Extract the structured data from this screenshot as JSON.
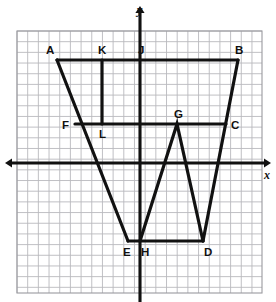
{
  "figure": {
    "background_color": "#ffffff",
    "ink_color": "#111111",
    "grid_color": "#b9b9bd",
    "axes": {
      "x_axis_label": "x",
      "y_axis_label": "y",
      "x_axis_pixel_y": 163,
      "y_axis_pixel_x": 140,
      "x_axis_span_px": [
        5,
        271
      ],
      "y_axis_span_px": [
        6,
        302
      ],
      "arrows": [
        "left",
        "right",
        "up"
      ]
    },
    "grid": {
      "cell_px": 10.68,
      "left_px": 17,
      "top_px": 31,
      "right_px": 262,
      "bottom_px": 293,
      "columns": 23,
      "rows": 24,
      "show_border": true
    },
    "points": [
      {
        "label": "A",
        "px": 57,
        "py": 60,
        "label_dx": -11,
        "label_dy": -15,
        "gx": -7.8,
        "gy": 9.6
      },
      {
        "label": "K",
        "px": 102,
        "py": 60,
        "label_dx": -4,
        "label_dy": -15,
        "gx": -3.6,
        "gy": 9.6
      },
      {
        "label": "J",
        "px": 140,
        "py": 60,
        "label_dx": -2,
        "label_dy": -15,
        "gx": 0,
        "gy": 9.6
      },
      {
        "label": "B",
        "px": 238,
        "py": 60,
        "label_dx": -3,
        "label_dy": -15,
        "gx": 9.2,
        "gy": 9.6
      },
      {
        "label": "F",
        "px": 75,
        "py": 124,
        "label_dx": -13,
        "label_dy": -4,
        "gx": -6.1,
        "gy": 3.7
      },
      {
        "label": "L",
        "px": 102,
        "py": 124,
        "label_dx": -3,
        "label_dy": 5,
        "gx": -3.6,
        "gy": 3.7
      },
      {
        "label": "G",
        "px": 177,
        "py": 124,
        "label_dx": -3,
        "label_dy": -15,
        "gx": 3.5,
        "gy": 3.7
      },
      {
        "label": "C",
        "px": 226,
        "py": 124,
        "label_dx": 5,
        "label_dy": -4,
        "gx": 8.1,
        "gy": 3.7
      },
      {
        "label": "E",
        "px": 128,
        "py": 241,
        "label_dx": -5,
        "label_dy": 6,
        "gx": -1.1,
        "gy": -7.3
      },
      {
        "label": "H",
        "px": 140,
        "py": 241,
        "label_dx": 1,
        "label_dy": 6,
        "gx": 0,
        "gy": -7.3
      },
      {
        "label": "D",
        "px": 203,
        "py": 241,
        "label_dx": 1,
        "label_dy": 6,
        "gx": 5.9,
        "gy": -7.3
      }
    ],
    "paths": [
      {
        "name": "outline-A-B",
        "d": "M 57 60 L 238 60"
      },
      {
        "name": "outline-B-C-D",
        "d": "M 238 60 L 203 241"
      },
      {
        "name": "outline-D-H",
        "d": "M 203 241 L 140 241"
      },
      {
        "name": "zigzag-H-G-E",
        "d": "M 140 241 L 177 124 L 203 241"
      },
      {
        "name": "outline-E-A",
        "d": "M 128 241 L 57 60"
      },
      {
        "name": "segment-F-C",
        "d": "M 75 124 L 226 124"
      },
      {
        "name": "segment-K-L",
        "d": "M 102 60 L 102 124"
      },
      {
        "name": "segment-E-H",
        "d": "M 128 241 L 140 241"
      }
    ]
  }
}
